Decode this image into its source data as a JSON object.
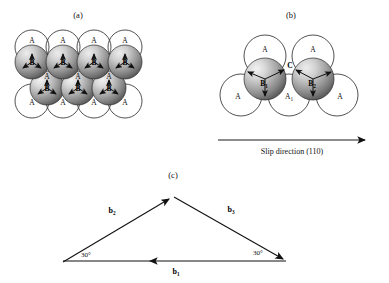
{
  "figure": {
    "background_color": "#ffffff",
    "line_color": "#111111",
    "sphere_light_color": "#d8d8d8",
    "sphere_dark_color": "#6f6f6f",
    "panels": [
      {
        "id": "panel-a",
        "caption": "(a)",
        "caption_x": 78,
        "caption_y": 18
      },
      {
        "id": "panel-b",
        "caption": "(b)",
        "caption_x": 291,
        "caption_y": 18
      },
      {
        "id": "panel-c",
        "caption": "(c)",
        "caption_x": 173,
        "caption_y": 178
      }
    ]
  },
  "panel_a": {
    "caption": "(a)",
    "outline_circles": [
      {
        "cx": 32,
        "cy": 47,
        "r": 17,
        "label": "A",
        "label_x": 32,
        "label_y": 43
      },
      {
        "cx": 63,
        "cy": 47,
        "r": 17,
        "label": "A",
        "label_x": 63,
        "label_y": 43
      },
      {
        "cx": 94,
        "cy": 47,
        "r": 17,
        "label": "A",
        "label_x": 94,
        "label_y": 43
      },
      {
        "cx": 125,
        "cy": 47,
        "r": 17,
        "label": "A",
        "label_x": 125,
        "label_y": 43
      },
      {
        "cx": 32,
        "cy": 101,
        "r": 17,
        "label": "A",
        "label_x": 32,
        "label_y": 105
      },
      {
        "cx": 63,
        "cy": 101,
        "r": 17,
        "label": "A",
        "label_x": 63,
        "label_y": 105
      },
      {
        "cx": 94,
        "cy": 101,
        "r": 17,
        "label": "A",
        "label_x": 94,
        "label_y": 105
      },
      {
        "cx": 125,
        "cy": 101,
        "r": 17,
        "label": "A",
        "label_x": 125,
        "label_y": 105
      }
    ],
    "shaded_spheres_row1": [
      {
        "cx": 32,
        "cy": 62,
        "r": 17,
        "label": "B",
        "label_x": 32,
        "label_y": 65
      },
      {
        "cx": 63,
        "cy": 62,
        "r": 17,
        "label": "B",
        "label_x": 63,
        "label_y": 65
      },
      {
        "cx": 94,
        "cy": 62,
        "r": 17,
        "label": "B",
        "label_x": 94,
        "label_y": 65
      },
      {
        "cx": 125,
        "cy": 62,
        "r": 17,
        "label": "B",
        "label_x": 125,
        "label_y": 65
      }
    ],
    "shaded_spheres_row2": [
      {
        "cx": 47,
        "cy": 88,
        "r": 17,
        "label": "B",
        "label_x": 47,
        "label_y": 91
      },
      {
        "cx": 78,
        "cy": 88,
        "r": 17,
        "label": "B",
        "label_x": 78,
        "label_y": 91
      },
      {
        "cx": 109,
        "cy": 88,
        "r": 17,
        "label": "B",
        "label_x": 109,
        "label_y": 91
      }
    ],
    "interstice_labels": [
      {
        "text": "A",
        "x": 47,
        "y": 79
      },
      {
        "text": "A",
        "x": 78,
        "y": 79
      },
      {
        "text": "A",
        "x": 109,
        "y": 79
      }
    ],
    "tripod_marks_row1": [
      {
        "cx": 32,
        "cy": 62
      },
      {
        "cx": 63,
        "cy": 62
      },
      {
        "cx": 94,
        "cy": 62
      },
      {
        "cx": 125,
        "cy": 62
      }
    ],
    "tripod_marks_row2": [
      {
        "cx": 47,
        "cy": 88
      },
      {
        "cx": 78,
        "cy": 88
      },
      {
        "cx": 109,
        "cy": 88
      }
    ]
  },
  "panel_b": {
    "caption": "(b)",
    "top_circles": [
      {
        "cx": 265,
        "cy": 56,
        "r": 21,
        "label": "A",
        "label_x": 265,
        "label_y": 52
      },
      {
        "cx": 313,
        "cy": 56,
        "r": 21,
        "label": "A",
        "label_x": 313,
        "label_y": 52
      }
    ],
    "bottom_circles": [
      {
        "cx": 241,
        "cy": 95,
        "r": 21,
        "label": "A",
        "label_x": 238,
        "label_y": 99
      },
      {
        "cx": 289,
        "cy": 95,
        "r": 21,
        "label": "A",
        "label_x": 289,
        "label_y": 99,
        "subscript": "1"
      },
      {
        "cx": 337,
        "cy": 95,
        "r": 21,
        "label": "A",
        "label_x": 340,
        "label_y": 99
      }
    ],
    "shaded_spheres": [
      {
        "cx": 265,
        "cy": 79,
        "r": 21,
        "label": "B",
        "subscript": "1",
        "label_x": 265,
        "label_y": 86
      },
      {
        "cx": 313,
        "cy": 79,
        "r": 21,
        "label": "B",
        "subscript": "2",
        "label_x": 313,
        "label_y": 86
      }
    ],
    "junction_label": {
      "text": "C",
      "x": 290,
      "y": 68
    },
    "slip_arrow": {
      "x1": 218,
      "y1": 140,
      "x2": 367,
      "y2": 140,
      "caption": "Slip direction (110)",
      "caption_x": 292,
      "caption_y": 154
    }
  },
  "panel_c": {
    "caption": "(c)",
    "vertices": {
      "left": {
        "x": 63,
        "y": 262
      },
      "apex": {
        "x": 173,
        "y": 197
      },
      "right": {
        "x": 286,
        "y": 261
      }
    },
    "vectors": [
      {
        "name": "b2",
        "label": "b",
        "subscript": "2",
        "label_x": 112,
        "label_y": 212,
        "from": "left",
        "to": "apex",
        "arrow_at": "end"
      },
      {
        "name": "b3",
        "label": "b",
        "subscript": "3",
        "label_x": 231,
        "label_y": 211,
        "from": "apex",
        "to": "right",
        "arrow_at": "end"
      },
      {
        "name": "b1",
        "label": "b",
        "subscript": "1",
        "label_x": 176,
        "label_y": 273,
        "from": "right",
        "to": "left",
        "arrow_at": "end"
      }
    ],
    "angles": [
      {
        "text": "30",
        "unit": "°",
        "x": 84,
        "y": 256
      },
      {
        "text": "30",
        "unit": "°",
        "x": 258,
        "y": 254
      }
    ]
  }
}
